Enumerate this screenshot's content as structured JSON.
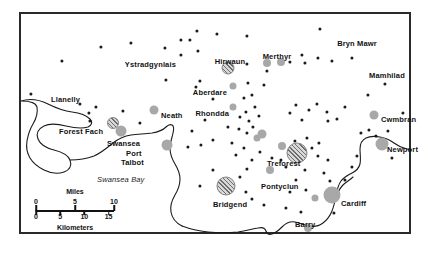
{
  "map": {
    "title": "South Wales industrial map",
    "frame": {
      "x": 19,
      "y": 12,
      "width": 392,
      "height": 222,
      "border_color": "#2a2a2a"
    },
    "background_color": "#ffffff",
    "water_labels": [
      {
        "text": "Swansea Bay",
        "x": 97,
        "y": 176
      }
    ],
    "place_labels": [
      {
        "name": "Ystradgynlais",
        "text": "Ystradgynlais",
        "x": 176,
        "y": 61,
        "anchor": "end"
      },
      {
        "name": "Hirwaun",
        "text": "Hirwaun",
        "x": 230,
        "y": 58,
        "anchor": "middle"
      },
      {
        "name": "Merthyr",
        "text": "Merthyr",
        "x": 277,
        "y": 53,
        "anchor": "middle"
      },
      {
        "name": "Bryn Mawr",
        "text": "Bryn Mawr",
        "x": 357,
        "y": 40,
        "anchor": "middle"
      },
      {
        "name": "Mamhilad",
        "text": "Mamhilad",
        "x": 387,
        "y": 72,
        "anchor": "middle"
      },
      {
        "name": "Aberdare",
        "text": "Aberdare",
        "x": 227,
        "y": 89,
        "anchor": "end"
      },
      {
        "name": "Llanelly",
        "text": "Llanelly",
        "x": 51,
        "y": 96,
        "anchor": "start"
      },
      {
        "name": "Neath",
        "text": "Neath",
        "x": 161,
        "y": 112,
        "anchor": "start"
      },
      {
        "name": "Rhondda",
        "text": "Rhondda",
        "x": 229,
        "y": 110,
        "anchor": "end"
      },
      {
        "name": "Cwmbran",
        "text": "Cwmbran",
        "x": 381,
        "y": 116,
        "anchor": "start"
      },
      {
        "name": "Forest Fach",
        "text": "Forest Fach",
        "x": 59,
        "y": 128,
        "anchor": "start"
      },
      {
        "name": "Swansea",
        "text": "Swansea",
        "x": 107,
        "y": 140,
        "anchor": "start"
      },
      {
        "name": "Newport",
        "text": "Newport",
        "x": 387,
        "y": 146,
        "anchor": "start"
      },
      {
        "name": "Port Talbot line 1",
        "text": "Port",
        "x": 126,
        "y": 150,
        "anchor": "start"
      },
      {
        "name": "Port Talbot line 2",
        "text": "Talbot",
        "x": 121,
        "y": 159,
        "anchor": "start"
      },
      {
        "name": "Treforest",
        "text": "Treforest",
        "x": 267,
        "y": 160,
        "anchor": "start"
      },
      {
        "name": "Pontyclun",
        "text": "Pontyclun",
        "x": 261,
        "y": 183,
        "anchor": "start"
      },
      {
        "name": "Cardiff",
        "text": "Cardiff",
        "x": 341,
        "y": 200,
        "anchor": "start"
      },
      {
        "name": "Bridgend",
        "text": "Bridgend",
        "x": 213,
        "y": 201,
        "anchor": "start"
      },
      {
        "name": "Barry",
        "text": "Barry",
        "x": 295,
        "y": 221,
        "anchor": "start"
      }
    ],
    "hatched_sites": [
      {
        "name": "Hirwaun estate",
        "x": 228,
        "y": 68,
        "r": 6.5
      },
      {
        "name": "Forest Fach estate",
        "x": 113,
        "y": 123,
        "r": 6.0
      },
      {
        "name": "Treforest estate",
        "x": 297,
        "y": 153,
        "r": 10.5
      },
      {
        "name": "Bridgend estate",
        "x": 226,
        "y": 186,
        "r": 9.5
      }
    ],
    "town_circles": [
      {
        "name": "Aberdare",
        "x": 233,
        "y": 86,
        "r": 3.5
      },
      {
        "name": "Merthyr west",
        "x": 267,
        "y": 63,
        "r": 4.0
      },
      {
        "name": "Merthyr east",
        "x": 281,
        "y": 62,
        "r": 4.0
      },
      {
        "name": "Neath",
        "x": 154,
        "y": 110,
        "r": 4.5
      },
      {
        "name": "Rhondda",
        "x": 233,
        "y": 107,
        "r": 3.5
      },
      {
        "name": "Cwmbran",
        "x": 374,
        "y": 115,
        "r": 4.5
      },
      {
        "name": "Swansea",
        "x": 121,
        "y": 131,
        "r": 5.5
      },
      {
        "name": "Port Talbot",
        "x": 167,
        "y": 145,
        "r": 5.5
      },
      {
        "name": "Upper valley town",
        "x": 262,
        "y": 134,
        "r": 4.5
      },
      {
        "name": "Mid valley town",
        "x": 282,
        "y": 146,
        "r": 4.0
      },
      {
        "name": "Newport",
        "x": 382,
        "y": 144,
        "r": 6.5
      },
      {
        "name": "Pontyclun",
        "x": 270,
        "y": 170,
        "r": 4.0
      },
      {
        "name": "Cardiff outer",
        "x": 315,
        "y": 198,
        "r": 3.5
      },
      {
        "name": "Cardiff",
        "x": 332,
        "y": 195,
        "r": 8.5
      },
      {
        "name": "Barry",
        "x": 308,
        "y": 228,
        "r": 4.0
      },
      {
        "name": "Lower valley town",
        "x": 257,
        "y": 138,
        "r": 3.5
      }
    ],
    "settlement_dots": [
      {
        "x": 62,
        "y": 61
      },
      {
        "x": 101,
        "y": 47
      },
      {
        "x": 131,
        "y": 43
      },
      {
        "x": 165,
        "y": 48
      },
      {
        "x": 181,
        "y": 40
      },
      {
        "x": 190,
        "y": 40
      },
      {
        "x": 181,
        "y": 55
      },
      {
        "x": 197,
        "y": 31
      },
      {
        "x": 198,
        "y": 51
      },
      {
        "x": 247,
        "y": 36
      },
      {
        "x": 217,
        "y": 34
      },
      {
        "x": 166,
        "y": 80
      },
      {
        "x": 200,
        "y": 81
      },
      {
        "x": 196,
        "y": 87
      },
      {
        "x": 247,
        "y": 64
      },
      {
        "x": 267,
        "y": 71
      },
      {
        "x": 290,
        "y": 62
      },
      {
        "x": 302,
        "y": 55
      },
      {
        "x": 305,
        "y": 63
      },
      {
        "x": 320,
        "y": 29
      },
      {
        "x": 318,
        "y": 58
      },
      {
        "x": 332,
        "y": 61
      },
      {
        "x": 352,
        "y": 58
      },
      {
        "x": 385,
        "y": 84
      },
      {
        "x": 368,
        "y": 95
      },
      {
        "x": 248,
        "y": 83
      },
      {
        "x": 264,
        "y": 85
      },
      {
        "x": 213,
        "y": 99
      },
      {
        "x": 244,
        "y": 98
      },
      {
        "x": 252,
        "y": 95
      },
      {
        "x": 255,
        "y": 107
      },
      {
        "x": 246,
        "y": 112
      },
      {
        "x": 240,
        "y": 117
      },
      {
        "x": 249,
        "y": 121
      },
      {
        "x": 259,
        "y": 116
      },
      {
        "x": 205,
        "y": 120
      },
      {
        "x": 228,
        "y": 127
      },
      {
        "x": 239,
        "y": 129
      },
      {
        "x": 247,
        "y": 133
      },
      {
        "x": 253,
        "y": 127
      },
      {
        "x": 290,
        "y": 113
      },
      {
        "x": 296,
        "y": 105
      },
      {
        "x": 302,
        "y": 120
      },
      {
        "x": 309,
        "y": 110
      },
      {
        "x": 317,
        "y": 104
      },
      {
        "x": 327,
        "y": 112
      },
      {
        "x": 328,
        "y": 121
      },
      {
        "x": 337,
        "y": 119
      },
      {
        "x": 345,
        "y": 107
      },
      {
        "x": 361,
        "y": 133
      },
      {
        "x": 369,
        "y": 130
      },
      {
        "x": 376,
        "y": 136
      },
      {
        "x": 392,
        "y": 158
      },
      {
        "x": 403,
        "y": 113
      },
      {
        "x": 31,
        "y": 94
      },
      {
        "x": 80,
        "y": 104
      },
      {
        "x": 89,
        "y": 113
      },
      {
        "x": 96,
        "y": 107
      },
      {
        "x": 90,
        "y": 121
      },
      {
        "x": 123,
        "y": 111
      },
      {
        "x": 140,
        "y": 123
      },
      {
        "x": 192,
        "y": 131
      },
      {
        "x": 201,
        "y": 145
      },
      {
        "x": 188,
        "y": 147
      },
      {
        "x": 213,
        "y": 140
      },
      {
        "x": 232,
        "y": 143
      },
      {
        "x": 244,
        "y": 148
      },
      {
        "x": 236,
        "y": 155
      },
      {
        "x": 252,
        "y": 160
      },
      {
        "x": 260,
        "y": 152
      },
      {
        "x": 272,
        "y": 158
      },
      {
        "x": 281,
        "y": 160
      },
      {
        "x": 286,
        "y": 167
      },
      {
        "x": 295,
        "y": 141
      },
      {
        "x": 307,
        "y": 138
      },
      {
        "x": 312,
        "y": 148
      },
      {
        "x": 319,
        "y": 143
      },
      {
        "x": 318,
        "y": 156
      },
      {
        "x": 328,
        "y": 160
      },
      {
        "x": 305,
        "y": 170
      },
      {
        "x": 324,
        "y": 173
      },
      {
        "x": 330,
        "y": 181
      },
      {
        "x": 345,
        "y": 180
      },
      {
        "x": 352,
        "y": 167
      },
      {
        "x": 296,
        "y": 180
      },
      {
        "x": 290,
        "y": 192
      },
      {
        "x": 306,
        "y": 190
      },
      {
        "x": 247,
        "y": 169
      },
      {
        "x": 240,
        "y": 177
      },
      {
        "x": 213,
        "y": 170
      },
      {
        "x": 200,
        "y": 186
      },
      {
        "x": 246,
        "y": 192
      },
      {
        "x": 252,
        "y": 199
      },
      {
        "x": 264,
        "y": 205
      },
      {
        "x": 286,
        "y": 208
      },
      {
        "x": 301,
        "y": 212
      },
      {
        "x": 334,
        "y": 213
      },
      {
        "x": 357,
        "y": 156
      },
      {
        "x": 388,
        "y": 131
      }
    ],
    "scalebar": {
      "name": "map-scale-bar",
      "miles_title": "Miles",
      "km_title": "Kilometers",
      "miles_ticks": [
        "0",
        "5",
        "10"
      ],
      "km_ticks": [
        "0",
        "5",
        "10",
        "15"
      ],
      "miles_positions": [
        0,
        50,
        100
      ],
      "km_positions": [
        0,
        31,
        62,
        93
      ]
    }
  }
}
